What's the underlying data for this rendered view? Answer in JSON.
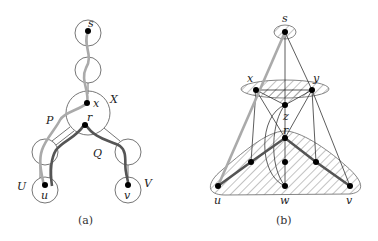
{
  "figure": {
    "panel_a": {
      "caption": "(a)",
      "node_labels": {
        "s": "s",
        "x": "x",
        "r": "r",
        "u": "u",
        "v": "v"
      },
      "set_labels": {
        "X": "X",
        "U": "U",
        "V": "V"
      },
      "path_labels": {
        "P": "P",
        "Q": "Q"
      },
      "colors": {
        "path_P": "#aaaaaa",
        "path_Q": "#555555",
        "circle": "#666666",
        "node": "#000000"
      }
    },
    "panel_b": {
      "caption": "(b)",
      "node_labels": {
        "s": "s",
        "x": "x",
        "y": "y",
        "z": "z",
        "r": "r",
        "u": "u",
        "w": "w",
        "v": "v"
      },
      "colors": {
        "hatch": "#888888",
        "thick_path": "#555555",
        "light_path": "#aaaaaa",
        "edge": "#333333",
        "node": "#000000"
      }
    }
  }
}
